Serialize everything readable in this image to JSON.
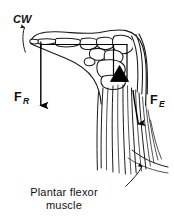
{
  "figure": {
    "background_color": "#ffffff",
    "ink_color": "#1a1a1a",
    "width": 174,
    "height": 220
  },
  "labels": {
    "rotation": {
      "text": "CW",
      "meaning": "clockwise rotation",
      "style": "italic-bold"
    },
    "force_reaction": {
      "symbol": "F",
      "subscript": "R",
      "meaning": "resistance force",
      "direction": "downward"
    },
    "force_effort": {
      "symbol": "F",
      "subscript": "E",
      "meaning": "effort force",
      "direction": "downward along muscle"
    },
    "caption": {
      "line1": "Plantar flexor",
      "line2": "muscle"
    }
  },
  "annotations": {
    "fulcrum": "ankle-joint-fulcrum-triangle",
    "leader_target": "plantar-flexor-muscle-fibers"
  },
  "colors": {
    "ink": "#1a1a1a",
    "vector": "#000000",
    "background": "#ffffff",
    "fulcrum": "#000000"
  }
}
